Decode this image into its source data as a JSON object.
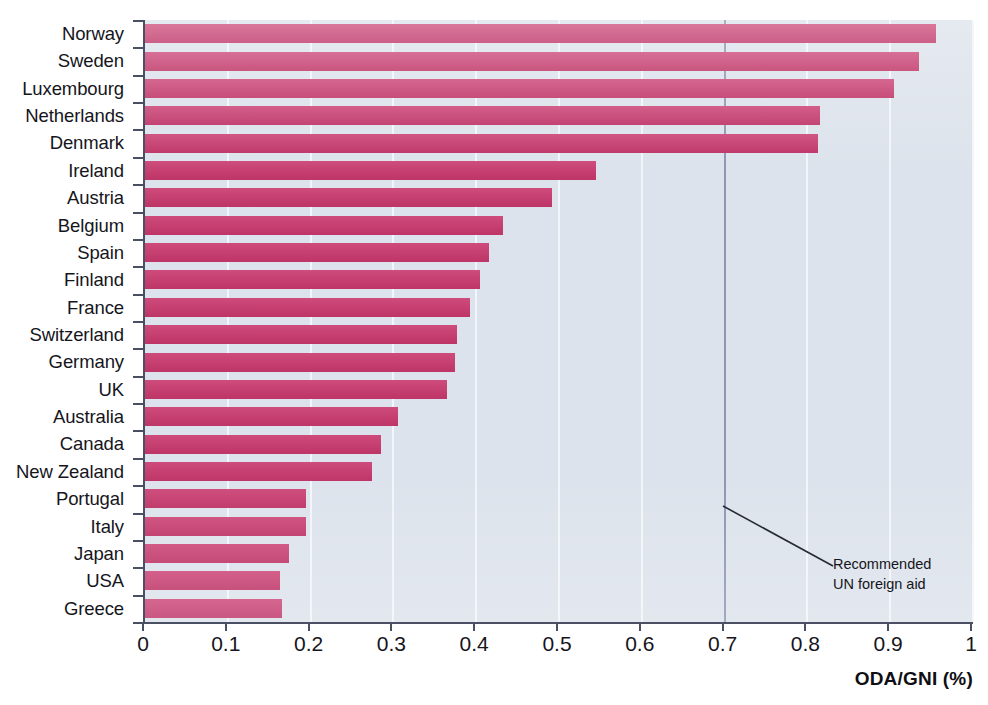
{
  "chart_data": {
    "type": "bar",
    "orientation": "horizontal",
    "title": "",
    "subtitle": "",
    "xlabel": "ODA/GNI (%)",
    "ylabel": "",
    "xlim": [
      0,
      1
    ],
    "xticks": [
      "0",
      "0.1",
      "0.2",
      "0.3",
      "0.4",
      "0.5",
      "0.6",
      "0.7",
      "0.8",
      "0.9",
      "1"
    ],
    "xtick_values": [
      0,
      0.1,
      0.2,
      0.3,
      0.4,
      0.5,
      0.6,
      0.7,
      0.8,
      0.9,
      1
    ],
    "grid": true,
    "grid_axis": "x",
    "legend": "none",
    "categories": [
      "Norway",
      "Sweden",
      "Luxembourg",
      "Netherlands",
      "Denmark",
      "Ireland",
      "Austria",
      "Belgium",
      "Spain",
      "Finland",
      "France",
      "Switzerland",
      "Germany",
      "UK",
      "Australia",
      "Canada",
      "New Zealand",
      "Portugal",
      "Italy",
      "Japan",
      "USA",
      "Greece"
    ],
    "values": [
      0.955,
      0.935,
      0.905,
      0.815,
      0.813,
      0.545,
      0.492,
      0.432,
      0.415,
      0.405,
      0.392,
      0.377,
      0.374,
      0.365,
      0.305,
      0.285,
      0.274,
      0.194,
      0.194,
      0.174,
      0.163,
      0.165
    ],
    "reference_line": {
      "value": 0.7,
      "label_line1": "Recommended",
      "label_line2": "UN foreign aid",
      "color": "#8f96b0"
    },
    "colors": {
      "bar": "#c8376c",
      "plot_background": "#dde3ec",
      "gridline": "#f2f5f9",
      "axis": "#4a4f63",
      "text": "#15151c"
    }
  },
  "annotation": {
    "line1": "Recommended",
    "line2": "UN foreign aid"
  },
  "axis": {
    "x_title": "ODA/GNI (%)"
  }
}
